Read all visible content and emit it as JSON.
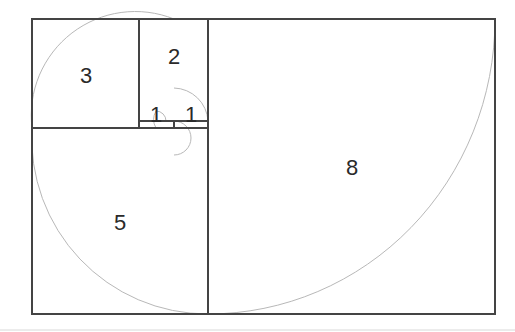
{
  "diagram": {
    "squares": [
      {
        "label": "1",
        "x": 139,
        "y": 121,
        "size": 35
      },
      {
        "label": "1",
        "x": 174,
        "y": 121,
        "size": 34
      },
      {
        "label": "2",
        "x": 139,
        "y": 19,
        "size": 69
      },
      {
        "label": "3",
        "x": 32,
        "y": 19,
        "size": 107
      },
      {
        "label": "5",
        "x": 32,
        "y": 128,
        "size": 176
      },
      {
        "label": "8",
        "x": 208,
        "y": 19,
        "size": 287
      }
    ],
    "colors": {
      "line": "#444444",
      "spiral": "#b8b8b8",
      "text": "#2a2a2a"
    }
  }
}
